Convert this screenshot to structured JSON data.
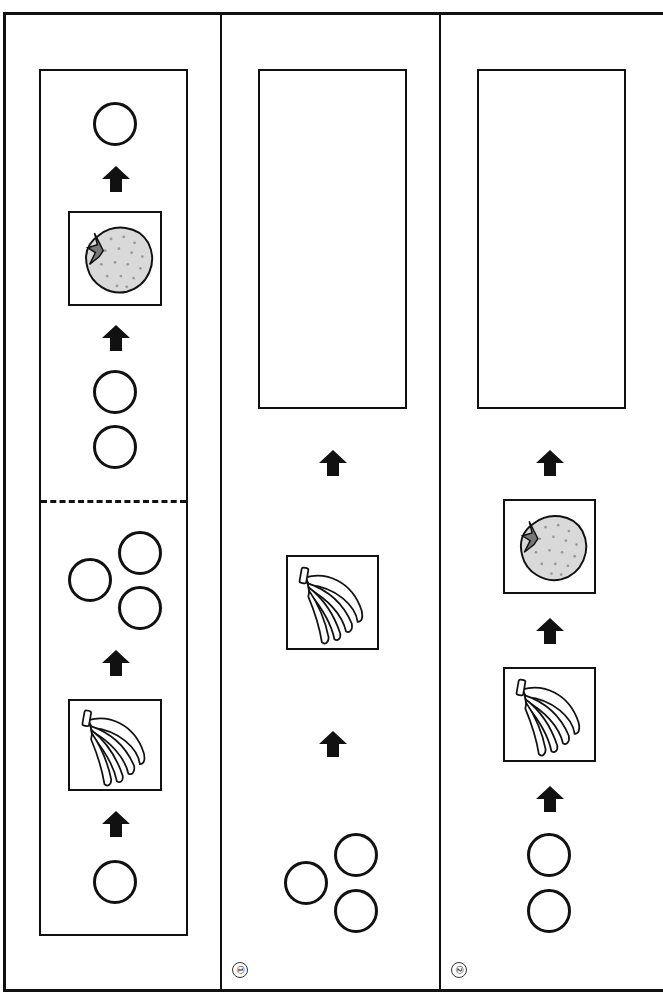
{
  "worksheet": {
    "description": "Fruit transformation chain puzzle: circles become fruits via arrows",
    "colors": {
      "line": "#111111",
      "strawberry_fill": "#d9d9d9",
      "strawberry_leaf": "#777777",
      "background": "#ffffff"
    },
    "panels": [
      {
        "id": "example",
        "label": "",
        "chain_bottom_to_top": [
          "circle x1",
          "banana card",
          "circle x3",
          "dashed divider",
          "circle x2",
          "strawberry card",
          "circle x1"
        ],
        "answer_box": "filled example"
      },
      {
        "id": "question-1",
        "label": "①",
        "chain_bottom_to_top": [
          "circle x3",
          "banana card",
          "empty answer box"
        ]
      },
      {
        "id": "question-2",
        "label": "②",
        "chain_bottom_to_top": [
          "circle x2",
          "banana card",
          "strawberry card",
          "empty answer box"
        ]
      }
    ],
    "icons": {
      "arrow": "arrow-up-icon",
      "strawberry": "strawberry-icon",
      "banana": "banana-icon",
      "circle": "circle-token"
    }
  }
}
